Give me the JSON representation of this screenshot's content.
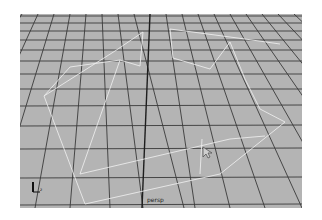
{
  "viewport": {
    "camera_label": "persp",
    "background_color": "#b4b4b4",
    "grid_color": "#3a3a3a",
    "wireframe_color": "#f2f2f2",
    "axis_gizmo": {
      "y_label": "",
      "z_label": "z"
    }
  }
}
